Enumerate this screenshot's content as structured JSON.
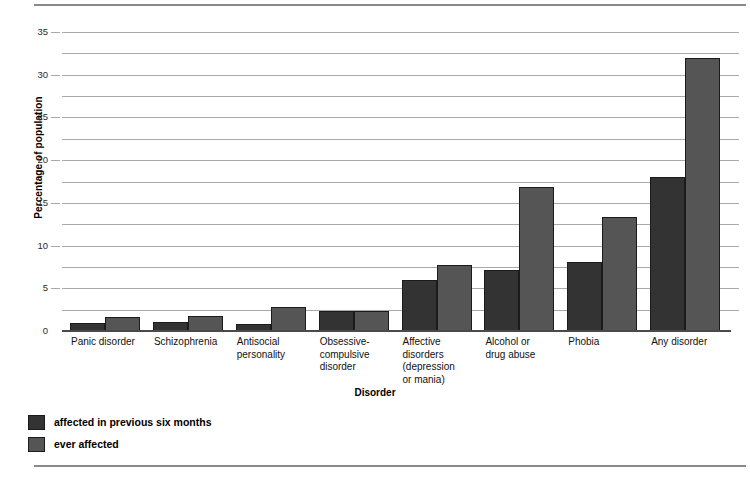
{
  "chart_data": {
    "type": "bar",
    "title": "",
    "xlabel": "Disorder",
    "ylabel": "Percentage of population",
    "ylim": [
      0,
      35
    ],
    "ytick_step": 5,
    "gridline_step": 2.5,
    "grid": true,
    "legend_position": "below-axis-left",
    "categories": [
      "Panic disorder",
      "Schizophrenia",
      "Antisocial personality",
      "Obsessive-compulsive disorder",
      "Affective disorders (depression or mania)",
      "Alcohol or drug abuse",
      "Phobia",
      "Any disorder"
    ],
    "category_label_lines": [
      [
        "Panic disorder"
      ],
      [
        "Schizophrenia"
      ],
      [
        "Antisocial",
        "personality"
      ],
      [
        "Obsessive-",
        "compulsive",
        "disorder"
      ],
      [
        "Affective",
        "disorders",
        "(depression",
        "or mania)"
      ],
      [
        "Alcohol or",
        "drug abuse"
      ],
      [
        "Phobia"
      ],
      [
        "Any disorder"
      ]
    ],
    "ytick_labels": [
      "0",
      "5",
      "10",
      "15",
      "20",
      "25",
      "30",
      "35"
    ],
    "ytick_values": [
      0,
      5,
      10,
      15,
      20,
      25,
      30,
      35
    ],
    "gridline_values": [
      2.5,
      5,
      7.5,
      10,
      12.5,
      15,
      17.5,
      20,
      22.5,
      25,
      27.5,
      30,
      32.5,
      35
    ],
    "series": [
      {
        "name": "affected in previous six months",
        "color": "#333333",
        "values": [
          0.9,
          1.0,
          0.8,
          2.4,
          6.0,
          7.2,
          8.1,
          18.0
        ]
      },
      {
        "name": "ever affected",
        "color": "#555555",
        "values": [
          1.6,
          1.7,
          2.8,
          2.4,
          7.7,
          16.8,
          13.3,
          32.0
        ]
      }
    ]
  },
  "legend": {
    "items": [
      {
        "label": "affected in previous six months",
        "swatch": "dark"
      },
      {
        "label": "ever affected",
        "swatch": "gray"
      }
    ]
  }
}
